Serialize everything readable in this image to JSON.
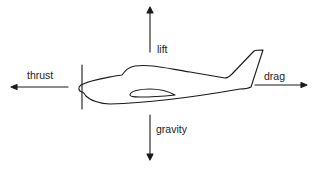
{
  "diagram": {
    "forces": {
      "lift": {
        "label": "lift",
        "direction": "up"
      },
      "thrust": {
        "label": "thrust",
        "direction": "left"
      },
      "drag": {
        "label": "drag",
        "direction": "right"
      },
      "gravity": {
        "label": "gravity",
        "direction": "down"
      }
    },
    "colors": {
      "line": "#1a1a1a",
      "text": "#222222",
      "background": "#ffffff"
    }
  }
}
